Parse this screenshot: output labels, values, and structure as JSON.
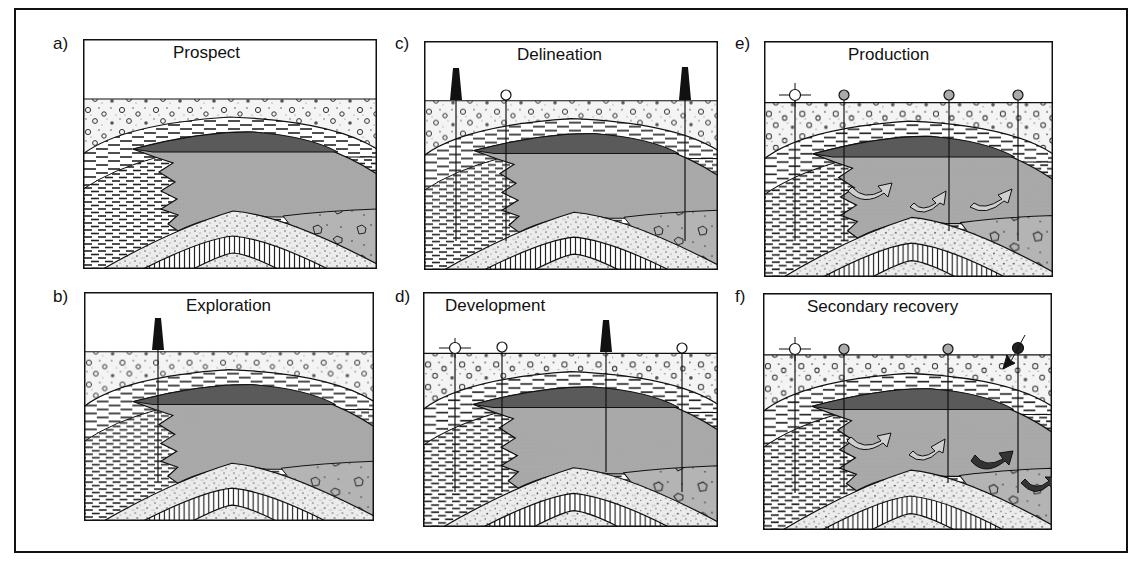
{
  "figure": {
    "colors": {
      "outline": "#111111",
      "gas_cap": "#5a5a5a",
      "oil_zone": "#a8a8a8",
      "water_zone": "#b4b4b4",
      "background": "#ffffff"
    },
    "panels": [
      {
        "id": "a",
        "label": "a)",
        "title": "Prospect",
        "wells": []
      },
      {
        "id": "b",
        "label": "b)",
        "title": "Exploration",
        "wells": [
          "derrick"
        ]
      },
      {
        "id": "c",
        "label": "c)",
        "title": "Delineation",
        "wells": [
          "derrick",
          "open-circle",
          "derrick"
        ]
      },
      {
        "id": "d",
        "label": "d)",
        "title": "Development",
        "wells": [
          "crosshair-circle",
          "open-circle",
          "derrick",
          "open-circle"
        ]
      },
      {
        "id": "e",
        "label": "e)",
        "title": "Production",
        "wells": [
          "crosshair-circle",
          "grey-circle",
          "grey-circle",
          "grey-circle"
        ]
      },
      {
        "id": "f",
        "label": "f)",
        "title": "Secondary recovery",
        "wells": [
          "crosshair-circle",
          "grey-circle",
          "grey-circle",
          "black-injector-circle"
        ]
      }
    ]
  }
}
